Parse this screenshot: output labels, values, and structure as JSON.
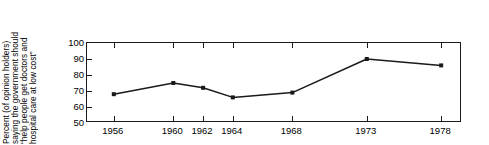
{
  "chart_data": {
    "type": "line",
    "title": "",
    "subtitle": "",
    "xlabel": "",
    "ylabel_lines": [
      "Percent (of opinion holders)",
      "saying the government should",
      "“help people get doctors and",
      "hospital care at low cost”"
    ],
    "ylabel": "Percent (of opinion holders) saying the government should “help people get doctors and hospital care at low cost”",
    "categories": [
      "1956",
      "1960",
      "1962",
      "1964",
      "1968",
      "1973",
      "1978"
    ],
    "x": [
      1956,
      1960,
      1962,
      1964,
      1968,
      1973,
      1978
    ],
    "values": [
      68,
      75,
      72,
      66,
      69,
      90,
      86
    ],
    "series": [
      {
        "name": "Percent favoring government help with low-cost medical care",
        "values": [
          68,
          75,
          72,
          66,
          69,
          90,
          86
        ]
      }
    ],
    "xlim": [
      1954.2,
      1979.4
    ],
    "ylim": [
      50,
      100
    ],
    "yticks": [
      50,
      60,
      70,
      80,
      90,
      100
    ],
    "ytick_labels": [
      "50",
      "60",
      "70",
      "80",
      "90",
      "100"
    ],
    "xticks": [
      1956,
      1960,
      1962,
      1964,
      1968,
      1973,
      1978
    ],
    "xtick_labels": [
      "1956",
      "1960",
      "1962",
      "1964",
      "1968",
      "1973",
      "1978"
    ],
    "grid": false,
    "legend": null,
    "legend_position": "none",
    "annotations": [],
    "marker": "square",
    "line_color": "#1a1a1a",
    "marker_color": "#1a1a1a",
    "axis_color": "#1a1a1a",
    "background_color": "#ffffff",
    "text_color": "#000000"
  }
}
